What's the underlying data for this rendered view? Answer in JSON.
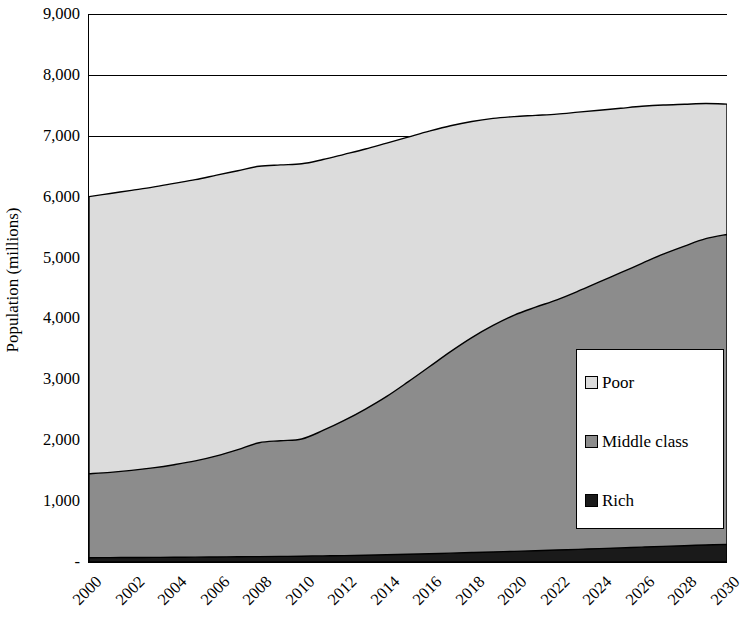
{
  "chart_data": {
    "type": "area",
    "stacked": true,
    "title": "",
    "xlabel": "",
    "ylabel": "Population (millions)",
    "ylim": [
      0,
      9000
    ],
    "xlim": [
      2000,
      2030
    ],
    "grid": true,
    "grid_axis": "y",
    "legend_position": "inside-right",
    "y_ticks": [
      {
        "value": 9000,
        "label": "9,000"
      },
      {
        "value": 8000,
        "label": "8,000"
      },
      {
        "value": 7000,
        "label": "7,000"
      },
      {
        "value": 6000,
        "label": "6,000"
      },
      {
        "value": 5000,
        "label": "5,000"
      },
      {
        "value": 4000,
        "label": "4,000"
      },
      {
        "value": 3000,
        "label": "3,000"
      },
      {
        "value": 2000,
        "label": "2,000"
      },
      {
        "value": 1000,
        "label": "1,000"
      },
      {
        "value": 0,
        "label": "-"
      }
    ],
    "x": [
      2000,
      2001,
      2002,
      2003,
      2004,
      2005,
      2006,
      2007,
      2008,
      2009,
      2010,
      2011,
      2012,
      2013,
      2014,
      2015,
      2016,
      2017,
      2018,
      2019,
      2020,
      2021,
      2022,
      2023,
      2024,
      2025,
      2026,
      2027,
      2028,
      2029,
      2030
    ],
    "x_tick_labels": [
      "2000",
      "2002",
      "2004",
      "2006",
      "2008",
      "2010",
      "2012",
      "2014",
      "2016",
      "2018",
      "2020",
      "2022",
      "2024",
      "2026",
      "2028",
      "2030"
    ],
    "series": [
      {
        "name": "Rich",
        "color": "#1a1a1a",
        "values": [
          70,
          72,
          74,
          76,
          78,
          80,
          83,
          86,
          89,
          92,
          95,
          100,
          105,
          112,
          120,
          128,
          136,
          145,
          155,
          165,
          175,
          185,
          196,
          208,
          220,
          232,
          244,
          256,
          268,
          280,
          290
        ]
      },
      {
        "name": "Middle class",
        "color": "#8c8c8c",
        "values": [
          1380,
          1400,
          1430,
          1470,
          1520,
          1580,
          1660,
          1760,
          1870,
          1900,
          1925,
          2060,
          2220,
          2400,
          2600,
          2830,
          3070,
          3310,
          3530,
          3720,
          3880,
          4000,
          4110,
          4240,
          4380,
          4520,
          4660,
          4800,
          4920,
          5030,
          5090
        ]
      },
      {
        "name": "Poor",
        "color": "#dcdcdc",
        "values": [
          4550,
          4580,
          4600,
          4610,
          4620,
          4620,
          4610,
          4580,
          4540,
          4530,
          4520,
          4450,
          4370,
          4270,
          4160,
          4020,
          3870,
          3710,
          3550,
          3400,
          3260,
          3150,
          3050,
          2940,
          2820,
          2700,
          2580,
          2450,
          2330,
          2220,
          2140
        ]
      }
    ],
    "stack_totals": [
      6000,
      6052,
      6104,
      6156,
      6218,
      6280,
      6353,
      6426,
      6499,
      6522,
      6540,
      6610,
      6695,
      6782,
      6880,
      6978,
      7076,
      7166,
      7235,
      7285,
      7315,
      7385,
      7456,
      7388,
      7420,
      7452,
      7484,
      7506,
      7518,
      7530,
      7520
    ]
  },
  "legend": {
    "items": [
      {
        "label": "Poor"
      },
      {
        "label": "Middle class"
      },
      {
        "label": "Rich"
      }
    ]
  }
}
